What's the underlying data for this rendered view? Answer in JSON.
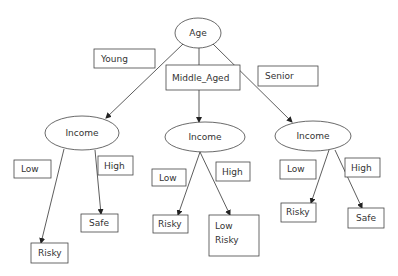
{
  "diagram": {
    "type": "decision-tree",
    "root": {
      "id": "age",
      "label": "Age"
    },
    "branch_labels": {
      "young": "Young",
      "middle_aged": "Middle_Aged",
      "senior": "Senior"
    },
    "subtrees": [
      {
        "id": "income-young",
        "label": "Income",
        "low_label": "Low",
        "high_label": "High",
        "low_leaf": "Risky",
        "high_leaf": "Safe"
      },
      {
        "id": "income-middle",
        "label": "Income",
        "low_label": "Low",
        "high_label": "High",
        "low_leaf": "Risky",
        "high_leaf_lines": [
          "Low",
          "Risky"
        ]
      },
      {
        "id": "income-senior",
        "label": "Income",
        "low_label": "Low",
        "high_label": "High",
        "low_leaf": "Risky",
        "high_leaf": "Safe"
      }
    ]
  }
}
